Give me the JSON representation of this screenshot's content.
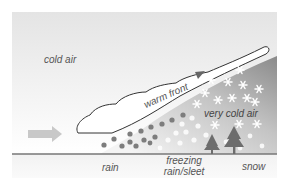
{
  "diagram": {
    "type": "warm-front-precipitation-cross-section",
    "labels": {
      "cold_air": "cold air",
      "warm_front": "warm front",
      "very_cold_air": "very cold air"
    },
    "ground_labels": {
      "rain": "rain",
      "freezing_line1": "freezing",
      "freezing_line2": "rain/sleet",
      "snow": "snow"
    },
    "icons": {
      "movement_arrow": "arrow-right-icon",
      "front_direction": "triangle-icon",
      "rain_drops": "dot-icon",
      "sleet_pellets": "white-dot-icon",
      "snowflakes": "snowflake-icon",
      "trees": "tree-icon",
      "cloud": "cloud-outline"
    },
    "colors": {
      "sky_top": "#e6e6e6",
      "sky_bottom": "#ffffff",
      "cold_wedge_dark": "#8c8c8c",
      "cold_wedge_light": "#f2f2f2",
      "rain": "#7a7a7a",
      "tree": "#6f6f6f",
      "arrow": "#c8c8c8",
      "ground_line": "#777777",
      "ground_band": "#f0f0f0",
      "text": "#555555"
    }
  }
}
